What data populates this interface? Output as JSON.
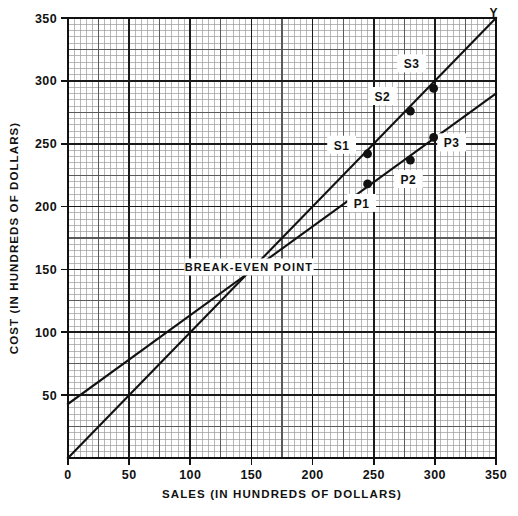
{
  "chart_data": {
    "type": "line",
    "title": "",
    "xlabel": "SALES (IN HUNDREDS OF DOLLARS)",
    "ylabel": "COST (IN HUNDREDS OF DOLLARS)",
    "xlim": [
      0,
      350
    ],
    "ylim": [
      0,
      350
    ],
    "xticks": [
      0,
      50,
      100,
      150,
      200,
      250,
      300,
      350
    ],
    "yticks": [
      0,
      50,
      100,
      150,
      200,
      250,
      300,
      350
    ],
    "xtick_labels": [
      "0",
      "50",
      "100",
      "150",
      "200",
      "250",
      "300",
      "350"
    ],
    "ytick_labels": [
      "0",
      "50",
      "100",
      "150",
      "200",
      "250",
      "300",
      "350"
    ],
    "grid": true,
    "grid_minor_step": 5,
    "grid_medium_step": 25,
    "grid_major_step": 50,
    "legend_position": "none",
    "series": [
      {
        "name": "sales-line",
        "type": "line",
        "x": [
          0,
          350
        ],
        "y": [
          0,
          350
        ],
        "slope": 1.0,
        "intercept": 0
      },
      {
        "name": "cost-line",
        "type": "line",
        "x": [
          0,
          350
        ],
        "y": [
          43,
          290
        ],
        "slope": 0.706,
        "intercept": 43
      }
    ],
    "points": [
      {
        "label": "S1",
        "x": 245,
        "y": 242,
        "on_series": "sales-line",
        "label_dx": -26,
        "label_dy": -6
      },
      {
        "label": "S2",
        "x": 280,
        "y": 276,
        "on_series": "sales-line",
        "label_dx": -28,
        "label_dy": -12
      },
      {
        "label": "S3",
        "x": 299,
        "y": 294,
        "on_series": "sales-line",
        "label_dx": -22,
        "label_dy": -22
      },
      {
        "label": "P1",
        "x": 245,
        "y": 218,
        "on_series": "cost-line",
        "label_dx": -6,
        "label_dy": 22
      },
      {
        "label": "P2",
        "x": 280,
        "y": 237,
        "on_series": "cost-line",
        "label_dx": -2,
        "label_dy": 22
      },
      {
        "label": "P3",
        "x": 299,
        "y": 255,
        "on_series": "cost-line",
        "label_dx": 18,
        "label_dy": 8
      }
    ],
    "annotations": [
      {
        "label": "BREAK-EVEN POINT",
        "x": 148,
        "y": 150,
        "anchor_x": 148,
        "anchor_y": 148
      },
      {
        "label": "Y",
        "x": 348,
        "y": 352
      }
    ]
  },
  "axes": {
    "x_title": "SALES (IN HUNDREDS OF DOLLARS)",
    "y_title": "COST (IN HUNDREDS OF DOLLARS)"
  },
  "colors": {
    "ink": "#111111",
    "grid_minor": "#9a9a9a",
    "grid_medium": "#5a5a5a",
    "grid_major": "#1a1a1a",
    "background": "#ffffff"
  }
}
